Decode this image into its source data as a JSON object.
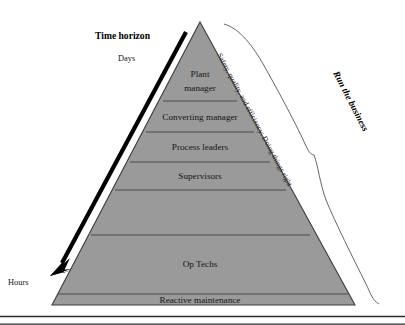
{
  "figure": {
    "type": "pyramid-diagram",
    "background_color": "#ffffff",
    "pyramid_fill": "#9a9a9a",
    "pyramid_stroke": "#3d3d3d",
    "divider_color": "#4a4a4a",
    "arrow_color": "#000000",
    "brace_color": "#555555"
  },
  "time_axis": {
    "title": "Time horizon",
    "top_label": "Days",
    "bottom_label": "Hours"
  },
  "pyramid": {
    "levels": [
      {
        "label": "Plant manager",
        "line1": "Plant",
        "line2": "manager"
      },
      {
        "label": "Converting manager",
        "line1": "Converting manager",
        "line2": ""
      },
      {
        "label": "Process leaders",
        "line1": "Process leaders",
        "line2": ""
      },
      {
        "label": "Supervisors",
        "line1": "Supervisors",
        "line2": ""
      },
      {
        "label": "Op Techs",
        "line1": "Op Techs",
        "line2": ""
      },
      {
        "label": "Reactive maintenance",
        "line1": "Reactive maintenance",
        "line2": ""
      }
    ]
  },
  "right_annotations": {
    "inner_note": "Safety, quality, and efficiency: Doing things right",
    "brace_title": "Run the business"
  }
}
